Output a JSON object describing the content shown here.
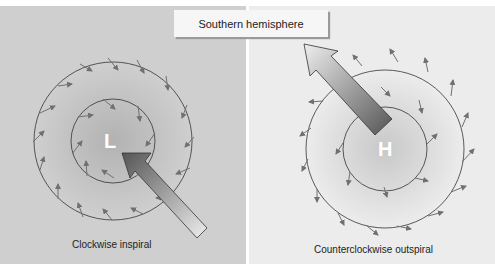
{
  "title": "Southern hemisphere",
  "panels": [
    {
      "id": "low",
      "center_label": "L",
      "caption": "Clockwise inspiral",
      "background": "#cfcfcf",
      "flow": "clockwise",
      "direction": "inward"
    },
    {
      "id": "high",
      "center_label": "H",
      "caption": "Counterclockwise outspiral",
      "background": "#ececec",
      "flow": "counterclockwise",
      "direction": "outward"
    }
  ],
  "colors": {
    "arrow_dark": "#555555",
    "arrow_light": "#eeeeee",
    "circle_line": "#333333",
    "wind_arrow": "#707070"
  }
}
